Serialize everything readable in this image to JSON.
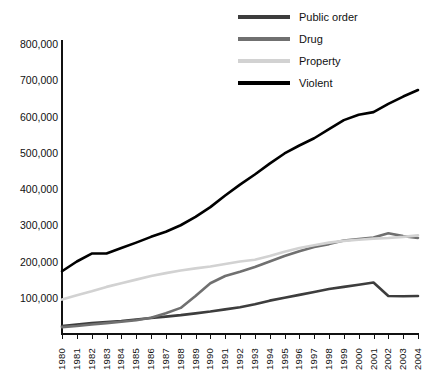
{
  "chart_data": {
    "type": "line",
    "title": "",
    "xlabel": "",
    "ylabel": "",
    "grid": false,
    "legend_position": "top-right",
    "xlim": [
      1980,
      2004
    ],
    "ylim": [
      0,
      800000
    ],
    "yticks": [
      "100,000",
      "200,000",
      "300,000",
      "400,000",
      "500,000",
      "600,000",
      "700,000",
      "800,000"
    ],
    "ytick_values": [
      100000,
      200000,
      300000,
      400000,
      500000,
      600000,
      700000,
      800000
    ],
    "categories": [
      "1980",
      "1981",
      "1982",
      "1983",
      "1984",
      "1985",
      "1986",
      "1987",
      "1988",
      "1989",
      "1990",
      "1991",
      "1992",
      "1993",
      "1994",
      "1995",
      "1996",
      "1997",
      "1998",
      "1999",
      "2000",
      "2001",
      "2002",
      "2003",
      "2004"
    ],
    "series": [
      {
        "name": "Public order",
        "color": "#3d3d3d",
        "values": [
          22000,
          26000,
          30000,
          33000,
          36000,
          40000,
          44000,
          48000,
          52000,
          57000,
          62000,
          68000,
          74000,
          82000,
          92000,
          100000,
          108000,
          116000,
          124000,
          130000,
          136000,
          142000,
          105000,
          104000,
          105000
        ]
      },
      {
        "name": "Drug",
        "color": "#707070",
        "values": [
          19000,
          22000,
          26000,
          30000,
          34000,
          38000,
          45000,
          57000,
          72000,
          105000,
          140000,
          160000,
          172000,
          185000,
          200000,
          215000,
          228000,
          240000,
          248000,
          258000,
          262000,
          266000,
          278000,
          270000,
          265000
        ]
      },
      {
        "name": "Property",
        "color": "#d2d2d2",
        "values": [
          95000,
          107000,
          118000,
          130000,
          140000,
          150000,
          160000,
          168000,
          175000,
          181000,
          186000,
          193000,
          200000,
          205000,
          215000,
          227000,
          237000,
          245000,
          252000,
          257000,
          260000,
          263000,
          265000,
          268000,
          272000
        ]
      },
      {
        "name": "Violent",
        "color": "#000000",
        "values": [
          173000,
          200000,
          222000,
          222000,
          237000,
          252000,
          268000,
          282000,
          300000,
          323000,
          350000,
          382000,
          412000,
          440000,
          470000,
          498000,
          520000,
          540000,
          565000,
          590000,
          605000,
          612000,
          635000,
          655000,
          673000
        ]
      }
    ]
  },
  "legend": {
    "items": [
      {
        "label": "Public order"
      },
      {
        "label": "Drug"
      },
      {
        "label": "Property"
      },
      {
        "label": "Violent"
      }
    ]
  }
}
